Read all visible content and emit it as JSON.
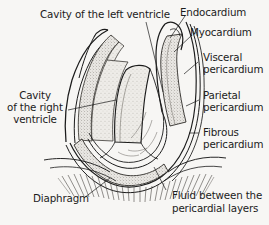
{
  "figure": {
    "background_color": "#f7f6f4",
    "ink_color": "#1b1b1b",
    "width": 269,
    "height": 225
  },
  "labels": {
    "cavity_left_ventricle": "Cavity of the left ventricle",
    "endocardium": "Endocardium",
    "myocardium": "Myocardium",
    "visceral_pericardium_l1": "Visceral",
    "visceral_pericardium_l2": "pericardium",
    "parietal_pericardium_l1": "Parietal",
    "parietal_pericardium_l2": "pericardium",
    "fibrous_pericardium_l1": "Fibrous",
    "fibrous_pericardium_l2": "pericardium",
    "cavity_right_ventricle_l1": "Cavity",
    "cavity_right_ventricle_l2": "of the right",
    "cavity_right_ventricle_l3": "ventricle",
    "diaphragm": "Diaphragm",
    "fluid_l1": "Fluid between the",
    "fluid_l2": "pericardial layers"
  }
}
